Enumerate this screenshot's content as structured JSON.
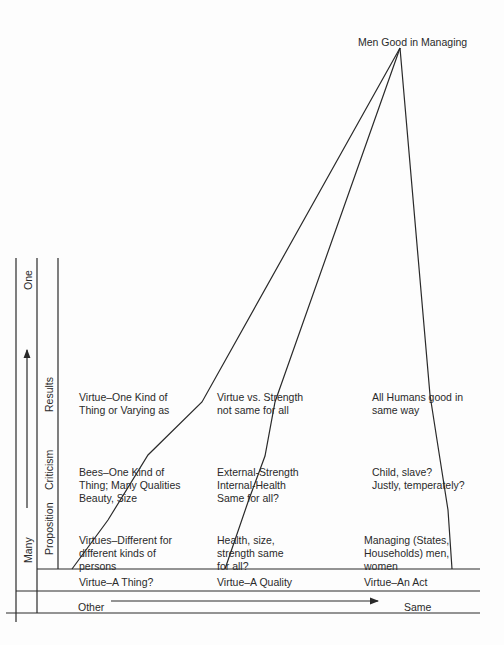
{
  "apex": {
    "label": "Men Good in Managing"
  },
  "vertical_axis": {
    "top_label": "One",
    "bottom_label": "Many",
    "arrow_direction": "up"
  },
  "row_labels": [
    "Results",
    "Criticism",
    "Proposition"
  ],
  "columns": [
    {
      "id": "thing",
      "results": "Virtue–One Kind of\nThing or Varying as",
      "criticism": "Bees–One Kind of\nThing; Many Qualities\nBeauty, Size",
      "proposition": "Virtues–Different for\ndifferent kinds of\npersons",
      "category": "Virtue–A Thing?"
    },
    {
      "id": "quality",
      "results": "Virtue vs. Strength\nnot same for all",
      "criticism": "External-Strength\nInternal-Health\nSame for all?",
      "proposition": "Health, size,\nstrength same\nfor all?",
      "category": "Virtue–A Quality"
    },
    {
      "id": "act",
      "results": "All Humans good in\nsame way",
      "criticism": "Child, slave?\nJustly, temperately?",
      "proposition": "Managing (States,\nHouseholds) men,\nwomen",
      "category": "Virtue–An Act"
    }
  ],
  "horizontal_axis": {
    "left_label": "Other",
    "right_label": "Same",
    "arrow_direction": "right"
  },
  "colors": {
    "line": "#2a2a2a",
    "text": "#2a2a2a",
    "background": "#fdfdfd"
  }
}
